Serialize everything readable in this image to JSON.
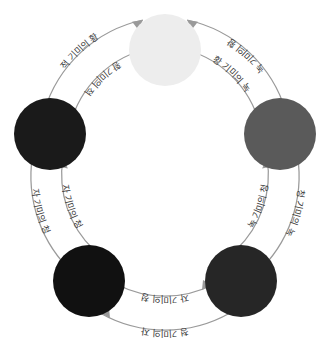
{
  "diagram": {
    "type": "color-relationship-cycle",
    "shape": "ring",
    "node_count": 6,
    "nodes": [
      {
        "id": "node-top",
        "position": "top",
        "fill": "#ededed",
        "angle_deg": -90,
        "radius": 36
      },
      {
        "id": "node-right",
        "position": "right",
        "fill": "#5a5a5a",
        "angle_deg": -30,
        "radius": 36
      },
      {
        "id": "node-bottom-right",
        "position": "bottom-right",
        "fill": "#262626",
        "angle_deg": 30,
        "radius": 36
      },
      {
        "id": "node-bottom-left",
        "position": "bottom-left",
        "fill": "#111111",
        "angle_deg": 150,
        "radius": 36
      },
      {
        "id": "node-left",
        "position": "left",
        "fill": "#1a1a1a",
        "angle_deg": -150,
        "radius": 36
      }
    ],
    "edges": [
      {
        "id": "edge-red-to-yellow",
        "track": "outer",
        "from": "node-left",
        "to": "node-top",
        "label": "적 기미의 황"
      },
      {
        "id": "edge-yellow-to-red",
        "track": "inner",
        "from": "node-top",
        "to": "node-left",
        "label": "황 기미의 적"
      },
      {
        "id": "edge-green-to-yellow",
        "track": "outer",
        "from": "node-right",
        "to": "node-top",
        "label": "녹 기미의 황"
      },
      {
        "id": "edge-yellow-to-green",
        "track": "inner",
        "from": "node-top",
        "to": "node-right",
        "label": "황 기미의 녹"
      },
      {
        "id": "edge-green-to-blue",
        "track": "inner",
        "from": "node-bottom-right",
        "to": "node-right",
        "label": "녹 기미의 청"
      },
      {
        "id": "edge-blue-to-green",
        "track": "outer",
        "from": "node-right",
        "to": "node-bottom-right",
        "label": "청 기미의 녹"
      },
      {
        "id": "edge-purple-to-blue",
        "track": "inner",
        "from": "node-bottom-right",
        "to": "node-bottom-left",
        "label": "자 기미의 청"
      },
      {
        "id": "edge-blue-to-purple",
        "track": "outer",
        "from": "node-bottom-right",
        "to": "node-bottom-left",
        "label": "청 기미의 자"
      },
      {
        "id": "edge-red-to-purple",
        "track": "inner",
        "from": "node-bottom-left",
        "to": "node-left",
        "label": "자 기미의 청"
      },
      {
        "id": "edge-purple-to-red",
        "track": "outer",
        "from": "node-left",
        "to": "node-bottom-left",
        "label": "자 기미의 청"
      }
    ],
    "palette": {
      "arrow": "#9a9a9a",
      "label_text": "#3a3a3a",
      "background": "#ffffff"
    }
  }
}
